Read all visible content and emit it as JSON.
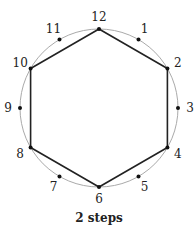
{
  "diagram": {
    "points": [
      "12",
      "1",
      "2",
      "3",
      "4",
      "5",
      "6",
      "7",
      "8",
      "9",
      "10",
      "11"
    ],
    "step": 2,
    "polygon_vertices": [
      "12",
      "2",
      "4",
      "6",
      "8",
      "10"
    ],
    "caption": "2 steps",
    "colors": {
      "circle": "#aaaaaa",
      "polygon": "#222222",
      "dots": "#111111",
      "text": "#222222"
    }
  }
}
